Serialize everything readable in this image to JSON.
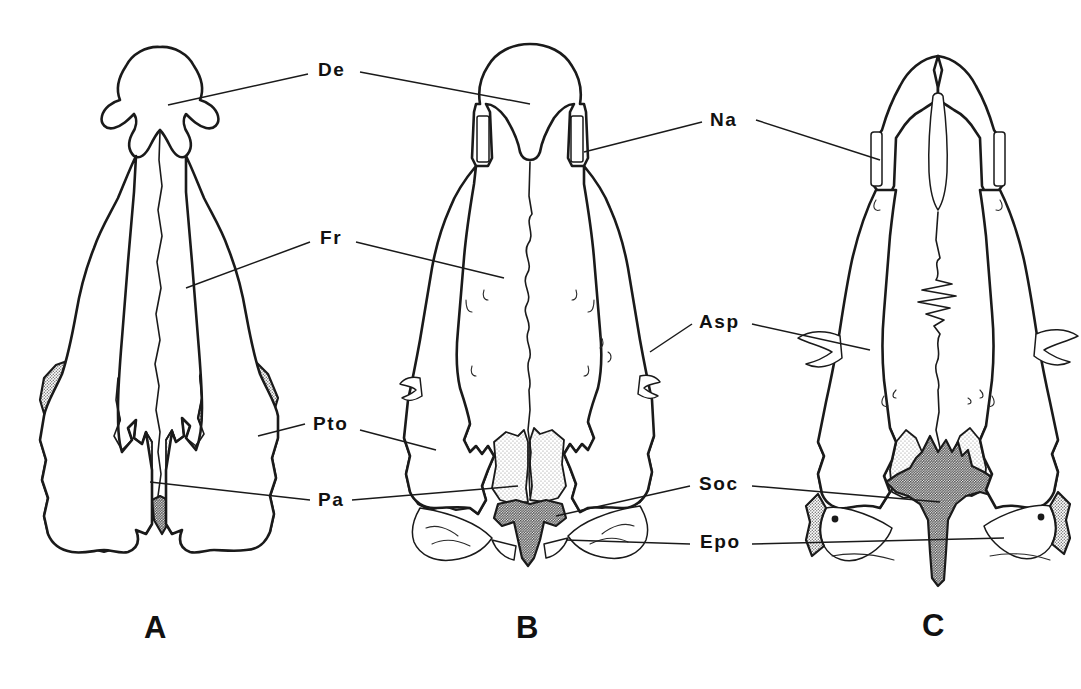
{
  "figure": {
    "background_color": "#ffffff",
    "ink_color": "#1a1a1a",
    "width": 1081,
    "height": 689
  },
  "labels": [
    {
      "id": "de",
      "text": "De",
      "x": 318,
      "y": 60,
      "full_name": "Dentary / dermal element"
    },
    {
      "id": "fr",
      "text": "Fr",
      "x": 320,
      "y": 228,
      "full_name": "Frontal"
    },
    {
      "id": "pto",
      "text": "Pto",
      "x": 313,
      "y": 418,
      "full_name": "Parietal-temporal / postorbital"
    },
    {
      "id": "pa",
      "text": "Pa",
      "x": 318,
      "y": 492,
      "full_name": "Parietal"
    },
    {
      "id": "na",
      "text": "Na",
      "x": 713,
      "y": 108,
      "full_name": "Nasal"
    },
    {
      "id": "asp",
      "text": "Asp",
      "x": 699,
      "y": 312,
      "full_name": "Alisphenoid"
    },
    {
      "id": "soc",
      "text": "Soc",
      "x": 699,
      "y": 478,
      "full_name": "Supraoccipital"
    },
    {
      "id": "epo",
      "text": "Epo",
      "x": 700,
      "y": 534,
      "full_name": "Exoccipital / epiotic"
    }
  ],
  "panels": [
    {
      "id": "a",
      "letter": "A",
      "x": 144,
      "y": 612
    },
    {
      "id": "b",
      "letter": "B",
      "x": 516,
      "y": 612
    },
    {
      "id": "c",
      "letter": "C",
      "x": 922,
      "y": 610
    }
  ],
  "shading": {
    "light_tone": "#e3e3e3",
    "medium_tone": "#c9c9c9",
    "dark_tone": "#9a9a9a"
  }
}
